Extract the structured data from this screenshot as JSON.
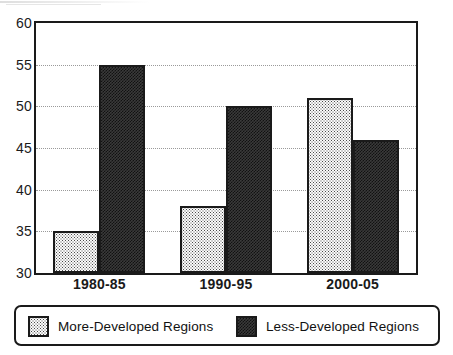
{
  "chart_data": {
    "type": "bar",
    "title": "",
    "subtitle": "",
    "xlabel": "",
    "ylabel": "",
    "categories": [
      "1980-85",
      "1990-95",
      "2000-05"
    ],
    "series": [
      {
        "name": "More-Developed Regions",
        "values": [
          35,
          38,
          51
        ],
        "fill": "light-stipple",
        "color": "#fbfbfb"
      },
      {
        "name": "Less-Developed Regions",
        "values": [
          55,
          50,
          46
        ],
        "fill": "dark-checker",
        "color": "#3a3a3a"
      }
    ],
    "ylim": [
      30,
      60
    ],
    "yticks": [
      30,
      35,
      40,
      45,
      50,
      55,
      60
    ],
    "ytick_labels": [
      "30",
      "35",
      "40",
      "45",
      "50",
      "55",
      "60"
    ],
    "grid": true,
    "grid_style": "dotted-horizontal",
    "grid_values": [
      35,
      40,
      45,
      50,
      55
    ],
    "legend_position": "bottom",
    "legend_entries": [
      "More-Developed Regions",
      "Less-Developed Regions"
    ],
    "annotations": []
  },
  "colors": {
    "axis": "#1a1a1a",
    "grid": "#9a9a9a",
    "background": "#ffffff",
    "series_light": "#fbfbfb",
    "series_dark": "#3a3a3a"
  }
}
